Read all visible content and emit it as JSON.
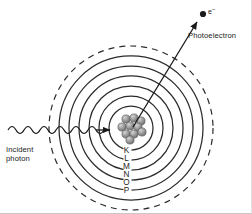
{
  "diagram": {
    "background_color": "#ffffff",
    "line_color": "#2b2b2b",
    "nucleus_color": "#8c8c8c",
    "labels": {
      "photoelectron": "Photoelectron",
      "electron_symbol": "e",
      "electron_charge": "−",
      "incident_photon_line1": "Incident",
      "incident_photon_line2": "photon"
    },
    "shells": [
      {
        "letter": "K",
        "top": 148
      },
      {
        "letter": "L",
        "top": 156
      },
      {
        "letter": "M",
        "top": 164
      },
      {
        "letter": "N",
        "top": 172
      },
      {
        "letter": "O",
        "top": 180
      },
      {
        "letter": "P",
        "top": 188
      }
    ],
    "geometry": {
      "center_x": 131,
      "center_y": 128,
      "shell_radii": [
        22,
        32,
        42,
        52,
        62,
        72
      ],
      "outer_dashed_radius": 82,
      "nucleus_radius": 14
    },
    "nucleus_particles": [
      {
        "cx": 126,
        "cy": 119,
        "r": 4.1
      },
      {
        "cx": 134,
        "cy": 118,
        "r": 4.1
      },
      {
        "cx": 141,
        "cy": 121,
        "r": 4.1
      },
      {
        "cx": 122,
        "cy": 127,
        "r": 4.1
      },
      {
        "cx": 130,
        "cy": 126,
        "r": 4.1
      },
      {
        "cx": 138,
        "cy": 127,
        "r": 4.1
      },
      {
        "cx": 126,
        "cy": 134,
        "r": 4.1
      },
      {
        "cx": 134,
        "cy": 134,
        "r": 4.1
      },
      {
        "cx": 142,
        "cy": 132,
        "r": 4.1
      },
      {
        "cx": 130,
        "cy": 140,
        "r": 4.1
      }
    ],
    "arrows": {
      "photoelectron_arrow": {
        "x1": 133,
        "y1": 127,
        "x2": 197,
        "y2": 22
      },
      "photon_arrow_tip": {
        "x": 107,
        "y": 130
      }
    },
    "photon_wave": {
      "start_x": 8,
      "y": 130,
      "amplitude": 5,
      "wavelength": 16,
      "cycles": 6
    }
  }
}
